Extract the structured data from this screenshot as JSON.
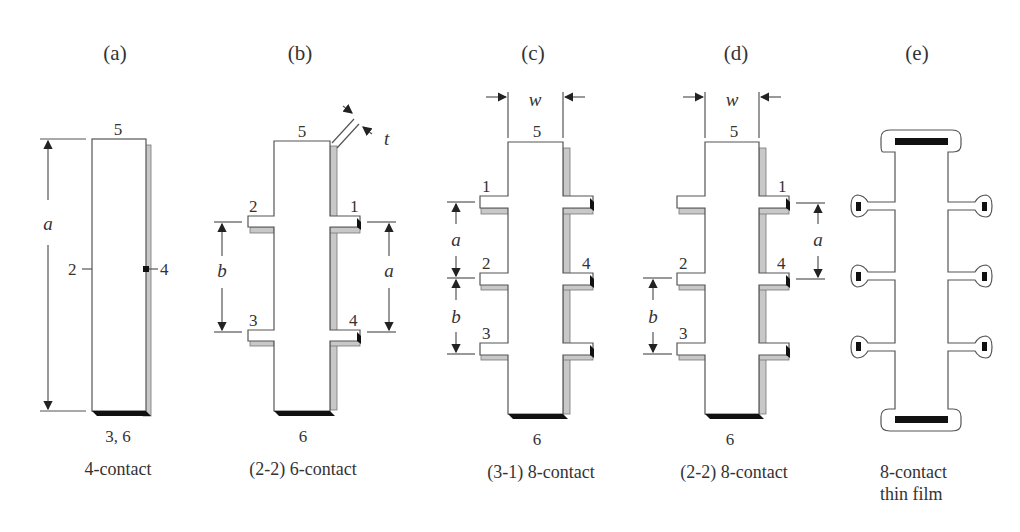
{
  "figure": {
    "panels": [
      {
        "id": "a",
        "title": "(a)",
        "caption": "4-contact",
        "caption2": "",
        "contacts": {
          "top": "5",
          "left": "2",
          "right": "4",
          "bottom": "3, 6"
        },
        "dims": {
          "vertical": "a"
        }
      },
      {
        "id": "b",
        "title": "(b)",
        "caption": "(2-2) 6-contact",
        "caption2": "",
        "contacts": {
          "top": "5",
          "upper_left": "2",
          "upper_right": "1",
          "lower_left": "3",
          "lower_right": "4",
          "bottom": "6"
        },
        "dims": {
          "left": "b",
          "right": "a",
          "thickness": "t"
        }
      },
      {
        "id": "c",
        "title": "(c)",
        "caption": "(3-1) 8-contact",
        "caption2": "",
        "contacts": {
          "top": "5",
          "left_1": "1",
          "left_2": "2",
          "left_3": "3",
          "right_2": "4",
          "bottom": "6"
        },
        "dims": {
          "width": "w",
          "upper": "a",
          "lower": "b"
        }
      },
      {
        "id": "d",
        "title": "(d)",
        "caption": "(2-2) 8-contact",
        "caption2": "",
        "contacts": {
          "top": "5",
          "right_1": "1",
          "left_2": "2",
          "left_3": "3",
          "right_2": "4",
          "bottom": "6"
        },
        "dims": {
          "width": "w",
          "right": "a",
          "left": "b"
        }
      },
      {
        "id": "e",
        "title": "(e)",
        "caption": "8-contact",
        "caption2": "thin film",
        "contacts": {},
        "dims": {}
      }
    ]
  }
}
